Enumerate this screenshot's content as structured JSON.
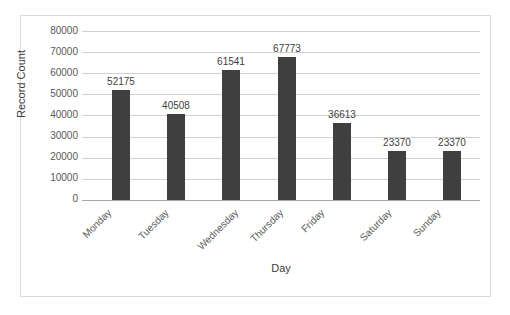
{
  "chart_data": {
    "type": "bar",
    "title": "",
    "categories": [
      "Monday",
      "Tuesday",
      "Wednesday",
      "Thursday",
      "Friday",
      "Saturday",
      "Sunday"
    ],
    "values": [
      52175,
      40508,
      61541,
      67773,
      36613,
      23370,
      23370
    ],
    "data_labels": [
      "52175",
      "40508",
      "61541",
      "67773",
      "36613",
      "23370",
      "23370"
    ],
    "xlabel": "Day",
    "ylabel": "Record Count",
    "ylim": [
      0,
      80000
    ],
    "ytick_labels": [
      "80000",
      "70000",
      "60000",
      "50000",
      "40000",
      "30000",
      "20000",
      "10000",
      "0"
    ],
    "ytick_values": [
      80000,
      70000,
      60000,
      50000,
      40000,
      30000,
      20000,
      10000,
      0
    ],
    "grid": true,
    "legend": false,
    "bar_color": "#3f3f3f",
    "gridline_color": "#d0d0d0",
    "axis_color": "#a6a6a6",
    "frame_color": "#d9d9d9",
    "text_color": "#595959",
    "xtick_rotation": "-45"
  }
}
